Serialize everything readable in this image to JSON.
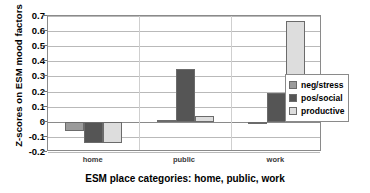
{
  "chart_data": {
    "type": "bar",
    "title": "",
    "xlabel": "ESM place categories:  home, public, work",
    "ylabel": "Z-scores on ESM mood factors",
    "categories": [
      "home",
      "public",
      "work"
    ],
    "series": [
      {
        "name": "neg/stress",
        "color": "#9b9b9b",
        "values": [
          -0.06,
          0.01,
          -0.01
        ]
      },
      {
        "name": "pos/social",
        "color": "#555555",
        "values": [
          -0.14,
          0.35,
          0.19
        ]
      },
      {
        "name": "productive",
        "color": "#dddddd",
        "values": [
          -0.14,
          0.04,
          0.67
        ]
      }
    ],
    "ylim": [
      -0.2,
      0.7
    ],
    "ytick_labels": [
      "0.7",
      "0.6",
      "0.5",
      "0.4",
      "0.3",
      "0.2",
      "0.1",
      "0",
      "-0.1",
      "-0.2"
    ],
    "ytick_values": [
      0.7,
      0.6,
      0.5,
      0.4,
      0.3,
      0.2,
      0.1,
      0,
      -0.1,
      -0.2
    ],
    "grid": true,
    "legend_position": "right",
    "legend": [
      "neg/stress",
      "pos/social",
      "productive"
    ]
  }
}
